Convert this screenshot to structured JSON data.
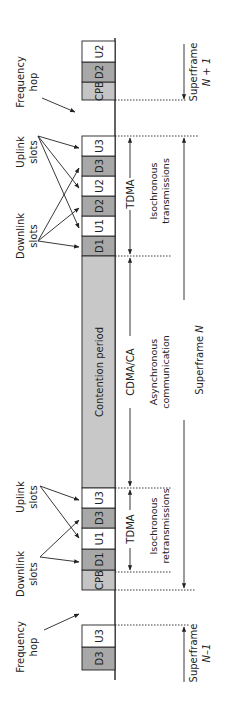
{
  "diagram": {
    "orientation": "rotated-90-ccw",
    "colors": {
      "background": "#ffffff",
      "downlink_slot": "#a8a8a8",
      "uplink_slot": "#ffffff",
      "cpb_slot": "#c4c4c4",
      "contention_slot": "#c8c8c8",
      "line": "#222222"
    },
    "superframe_next": {
      "label_line1": "Superframe",
      "label_line2": "N + 1",
      "slots": [
        {
          "name": "CPB",
          "type": "cpb",
          "y0": 82,
          "y1": 100
        },
        {
          "name": "D2",
          "type": "downlink",
          "y0": 62,
          "y1": 82
        },
        {
          "name": "U2",
          "type": "uplink",
          "y0": 41,
          "y1": 62
        }
      ]
    },
    "superframe_current": {
      "label_line1": "Superframe",
      "label_line2": "N",
      "slots_tail": [
        {
          "name": "D1",
          "type": "downlink",
          "y0": 236,
          "y1": 256
        },
        {
          "name": "U1",
          "type": "uplink",
          "y0": 216,
          "y1": 236
        },
        {
          "name": "D2",
          "type": "downlink",
          "y0": 196,
          "y1": 216
        },
        {
          "name": "U2",
          "type": "uplink",
          "y0": 176,
          "y1": 196
        },
        {
          "name": "D3",
          "type": "downlink",
          "y0": 156,
          "y1": 176
        },
        {
          "name": "U3",
          "type": "uplink",
          "y0": 136,
          "y1": 156
        }
      ],
      "contention": {
        "name": "Contention period",
        "y0": 256,
        "y1": 488
      },
      "slots_head": [
        {
          "name": "CPB",
          "type": "cpb",
          "y0": 570,
          "y1": 590
        },
        {
          "name": "D1",
          "type": "downlink",
          "y0": 549,
          "y1": 570
        },
        {
          "name": "U1",
          "type": "uplink",
          "y0": 528,
          "y1": 549
        },
        {
          "name": "D3",
          "type": "downlink",
          "y0": 508,
          "y1": 528
        },
        {
          "name": "U3",
          "type": "uplink",
          "y0": 488,
          "y1": 508
        }
      ]
    },
    "superframe_prev": {
      "label_line1": "Superframe",
      "label_line2": "N–1",
      "slots": [
        {
          "name": "D3",
          "type": "downlink",
          "y0": 647,
          "y1": 670
        },
        {
          "name": "U3",
          "type": "uplink",
          "y0": 625,
          "y1": 647
        }
      ]
    },
    "annotations": {
      "frequency_hop_top_line1": "Frequency",
      "frequency_hop_top_line2": "hop",
      "frequency_hop_bottom_line1": "Frequency",
      "frequency_hop_bottom_line2": "hop",
      "uplink_slots_top_line1": "Uplink",
      "uplink_slots_top_line2": "slots",
      "downlink_slots_top_line1": "Downlink",
      "downlink_slots_top_line2": "slots",
      "uplink_slots_bottom_line1": "Uplink",
      "uplink_slots_bottom_line2": "slots",
      "downlink_slots_bottom_line1": "Downlink",
      "downlink_slots_bottom_line2": "slots",
      "tdma_top": "TDMA",
      "tdma_bottom": "TDMA",
      "cdma_ca": "CDMA/CA",
      "isochronous_transmissions_line1": "Isochronous",
      "isochronous_transmissions_line2": "transmissions",
      "asynchronous_line1": "Asynchronous",
      "asynchronous_line2": "communication",
      "isochronous_retransmissions_line1": "Isochronous",
      "isochronous_retransmissions_line2": "retransmissions"
    }
  }
}
